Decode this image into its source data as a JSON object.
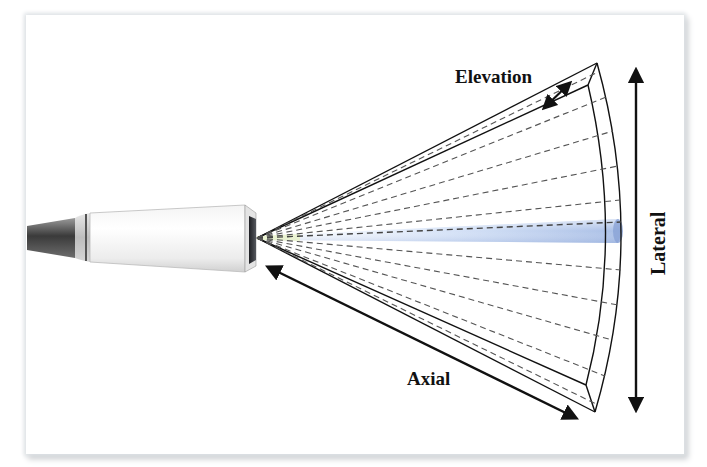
{
  "diagram": {
    "type": "ultrasound-transducer-beam-geometry",
    "labels": {
      "elevation": "Elevation",
      "lateral": "Lateral",
      "axial": "Axial"
    },
    "components": {
      "transducer": "transducer-probe",
      "beam": "focused-beam",
      "fan": "imaging-sector-volume"
    },
    "colors": {
      "line": "#111111",
      "dashed": "#555555",
      "beam": "#a9c2e6",
      "probe_dark": "#4a4a4a",
      "probe_face": "#2f3136"
    },
    "scan_lines": 11
  }
}
